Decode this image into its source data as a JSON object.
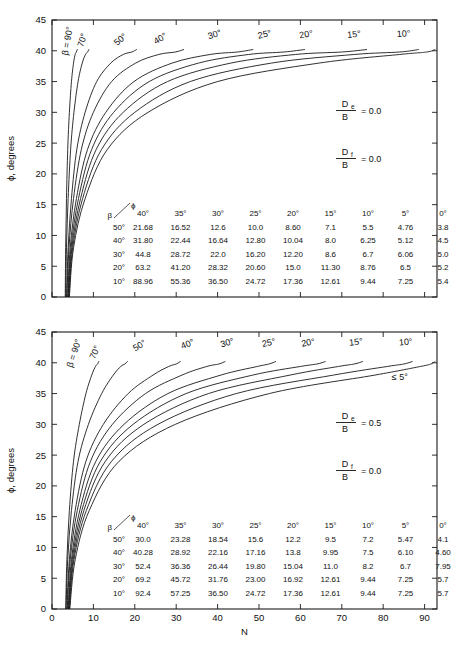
{
  "figure": {
    "axis": {
      "ylabel": "ϕ, degrees",
      "xlabel": "N",
      "yticks": [
        0,
        5,
        10,
        15,
        20,
        25,
        30,
        35,
        40,
        45
      ],
      "xticks": [
        0,
        10,
        20,
        30,
        40,
        50,
        60,
        70,
        80,
        90
      ],
      "xlim": [
        0,
        93
      ],
      "ylim": [
        0,
        45
      ],
      "xtick_labels_visible_top": false,
      "xtick_labels_visible_bottom": true,
      "grid": false
    },
    "line_color": "#1a1a1a"
  },
  "chart_data": [
    {
      "type": "line",
      "panel": "top",
      "title": "",
      "xlabel": "",
      "ylabel": "ϕ, degrees",
      "xlim": [
        0,
        93
      ],
      "ylim": [
        0,
        45
      ],
      "grid": false,
      "legend_position": "inline-curve-labels",
      "annotations": [
        {
          "numerator": "D",
          "subscript": "e",
          "denominator": "B",
          "equals": "= 0.0"
        },
        {
          "numerator": "D",
          "subscript": "f",
          "denominator": "B",
          "equals": "= 0.0"
        }
      ],
      "curve_labels": [
        {
          "text": "β = 90°",
          "x": 4.4,
          "y": 41.5,
          "rotate": -80
        },
        {
          "text": "70°",
          "x": 8.0,
          "y": 41.6,
          "rotate": -72
        },
        {
          "text": "50°",
          "x": 17.0,
          "y": 41.5,
          "rotate": -42
        },
        {
          "text": "40°",
          "x": 26.5,
          "y": 41.6,
          "rotate": -32
        },
        {
          "text": "30°",
          "x": 39.5,
          "y": 42.2,
          "rotate": -18
        },
        {
          "text": "25°",
          "x": 51.5,
          "y": 42.2,
          "rotate": -12
        },
        {
          "text": "20°",
          "x": 61.5,
          "y": 42.2,
          "rotate": -9
        },
        {
          "text": "15°",
          "x": 73.0,
          "y": 42.2,
          "rotate": -6
        },
        {
          "text": "10°",
          "x": 85.0,
          "y": 42.3,
          "rotate": -4
        }
      ],
      "series": [
        {
          "name": "β = 90°",
          "x": [
            3.2,
            3.3,
            3.5,
            3.8,
            4.2,
            4.7,
            5.2,
            5.6,
            5.9,
            6.1
          ],
          "values": [
            0,
            8,
            16,
            24,
            30,
            35,
            38,
            39.4,
            39.8,
            40.2
          ]
        },
        {
          "name": "70°",
          "x": [
            3.3,
            3.5,
            3.9,
            4.5,
            5.3,
            6.3,
            7.3,
            8.1,
            8.6,
            8.9
          ],
          "values": [
            0,
            8,
            16,
            24,
            30,
            35,
            38,
            39.4,
            39.8,
            40.2
          ]
        },
        {
          "name": "50°",
          "x": [
            3.5,
            3.9,
            4.7,
            6.0,
            8.0,
            10.8,
            14.2,
            17.2,
            19.3,
            20.4
          ],
          "values": [
            0,
            8,
            16,
            24,
            30,
            35,
            38,
            39.4,
            39.8,
            40.2
          ]
        },
        {
          "name": "40°",
          "x": [
            3.6,
            4.1,
            5.2,
            7.1,
            10.0,
            14.4,
            20.2,
            25.8,
            29.8,
            31.8
          ],
          "values": [
            0,
            8,
            16,
            24,
            30,
            35,
            38,
            39.4,
            39.8,
            40.2
          ]
        },
        {
          "name": "30°",
          "x": [
            3.8,
            4.4,
            5.9,
            8.6,
            13.0,
            19.8,
            29.0,
            38.2,
            44.8,
            48.5
          ],
          "values": [
            0,
            8,
            16,
            24,
            30,
            35,
            38,
            39.4,
            39.8,
            40.2
          ]
        },
        {
          "name": "25°",
          "x": [
            3.9,
            4.6,
            6.4,
            9.6,
            14.9,
            23.5,
            35.4,
            47.5,
            56.0,
            61.0
          ],
          "values": [
            0,
            8,
            16,
            24,
            30,
            35,
            38,
            39.4,
            39.8,
            40.2
          ]
        },
        {
          "name": "20°",
          "x": [
            4.0,
            4.8,
            6.9,
            10.7,
            17.2,
            27.9,
            43.2,
            58.8,
            70.0,
            76.0
          ],
          "values": [
            0,
            8,
            16,
            24,
            30,
            35,
            38,
            39.4,
            39.8,
            40.2
          ]
        },
        {
          "name": "15°",
          "x": [
            4.1,
            5.0,
            7.4,
            12.0,
            20.0,
            33.4,
            53.0,
            73.0,
            84.0,
            88.5
          ],
          "values": [
            0,
            8,
            16,
            24,
            30,
            35,
            38,
            39.4,
            39.8,
            40.2
          ]
        },
        {
          "name": "10°",
          "x": [
            4.2,
            5.2,
            8.0,
            13.4,
            23.2,
            40.0,
            64.5,
            84.0,
            90.5,
            92.5
          ],
          "values": [
            0,
            8,
            16,
            24,
            30,
            35,
            38,
            39.4,
            39.8,
            40.2
          ]
        }
      ],
      "table": {
        "corner_row_label": "β",
        "corner_col_label": "ϕ",
        "columns": [
          "40°",
          "35°",
          "30°",
          "25°",
          "20°",
          "15°",
          "10°",
          "5°",
          "0°"
        ],
        "rows": [
          {
            "label": "50°",
            "cells": [
              "21.68",
              "16.52",
              "12.6",
              "10.0",
              "8.60",
              "7.1",
              "5.5",
              "4.76",
              "3.8"
            ]
          },
          {
            "label": "40°",
            "cells": [
              "31.80",
              "22.44",
              "16.64",
              "12.80",
              "10.04",
              "8.0",
              "6.25",
              "5.12",
              "4.5"
            ]
          },
          {
            "label": "30°",
            "cells": [
              "44.8",
              "28.72",
              "22.0",
              "16.20",
              "12.20",
              "8.6",
              "6.7",
              "6.06",
              "5.0"
            ]
          },
          {
            "label": "20°",
            "cells": [
              "63.2",
              "41.20",
              "28.32",
              "20.60",
              "15.0",
              "11.30",
              "8.76",
              "6.5",
              "5.2"
            ]
          },
          {
            "label": "10°",
            "cells": [
              "88.96",
              "55.36",
              "36.50",
              "24.72",
              "17.36",
              "12.61",
              "9.44",
              "7.25",
              "5.4"
            ]
          }
        ]
      }
    },
    {
      "type": "line",
      "panel": "bottom",
      "title": "",
      "xlabel": "N",
      "ylabel": "ϕ, degrees",
      "xlim": [
        0,
        93
      ],
      "ylim": [
        0,
        45
      ],
      "grid": false,
      "legend_position": "inline-curve-labels",
      "annotations": [
        {
          "numerator": "D",
          "subscript": "e",
          "denominator": "B",
          "equals": "= 0.5"
        },
        {
          "numerator": "D",
          "subscript": "f",
          "denominator": "B",
          "equals": "= 0.0"
        }
      ],
      "extra_labels": [
        {
          "text": "≤ 5°",
          "x": 84.0,
          "y": 37.2
        }
      ],
      "curve_labels": [
        {
          "text": "β = 90°",
          "x": 6.0,
          "y": 41.4,
          "rotate": -72
        },
        {
          "text": "70°",
          "x": 11.0,
          "y": 41.5,
          "rotate": -66
        },
        {
          "text": "50°",
          "x": 21.5,
          "y": 42.4,
          "rotate": -32
        },
        {
          "text": "40°",
          "x": 33.0,
          "y": 42.6,
          "rotate": -22
        },
        {
          "text": "30°",
          "x": 42.5,
          "y": 42.8,
          "rotate": -16
        },
        {
          "text": "25°",
          "x": 52.5,
          "y": 42.8,
          "rotate": -12
        },
        {
          "text": "20°",
          "x": 62.0,
          "y": 42.8,
          "rotate": -10
        },
        {
          "text": "15°",
          "x": 73.5,
          "y": 42.9,
          "rotate": -7
        },
        {
          "text": "10°",
          "x": 85.5,
          "y": 42.9,
          "rotate": -5
        }
      ],
      "series": [
        {
          "name": "β = 90°",
          "x": [
            3.3,
            3.6,
            4.2,
            5.2,
            6.6,
            8.2,
            9.6,
            10.5,
            11.0,
            11.3
          ],
          "values": [
            0,
            8,
            16,
            24,
            30,
            35,
            38,
            39.4,
            39.8,
            40.2
          ]
        },
        {
          "name": "70°",
          "x": [
            3.4,
            3.8,
            4.7,
            6.3,
            8.8,
            12.0,
            14.8,
            16.6,
            17.6,
            18.2
          ],
          "values": [
            0,
            8,
            16,
            24,
            30,
            35,
            38,
            39.4,
            39.8,
            40.2
          ]
        },
        {
          "name": "50°",
          "x": [
            3.6,
            4.2,
            5.6,
            8.2,
            12.4,
            18.4,
            24.4,
            28.2,
            30.0,
            31.0
          ],
          "values": [
            0,
            8,
            16,
            24,
            30,
            35,
            38,
            39.4,
            39.8,
            40.2
          ]
        },
        {
          "name": "40°",
          "x": [
            3.7,
            4.4,
            6.1,
            9.3,
            14.6,
            22.6,
            31.4,
            37.4,
            40.3,
            41.8
          ],
          "values": [
            0,
            8,
            16,
            24,
            30,
            35,
            38,
            39.4,
            39.8,
            40.2
          ]
        },
        {
          "name": "30°",
          "x": [
            3.9,
            4.7,
            6.7,
            10.6,
            17.4,
            28.0,
            40.8,
            49.6,
            52.4,
            54.0
          ],
          "values": [
            0,
            8,
            16,
            24,
            30,
            35,
            38,
            39.4,
            39.8,
            40.2
          ]
        },
        {
          "name": "25°",
          "x": [
            4.0,
            4.9,
            7.2,
            11.7,
            19.6,
            32.4,
            48.5,
            60.0,
            64.0,
            66.0
          ],
          "values": [
            0,
            8,
            16,
            24,
            30,
            35,
            38,
            39.4,
            39.8,
            40.2
          ]
        },
        {
          "name": "20°",
          "x": [
            4.1,
            5.1,
            7.7,
            12.9,
            22.2,
            37.8,
            57.5,
            69.2,
            73.0,
            75.0
          ],
          "values": [
            0,
            8,
            16,
            24,
            30,
            35,
            38,
            39.4,
            39.8,
            40.2
          ]
        },
        {
          "name": "15°",
          "x": [
            4.2,
            5.3,
            8.3,
            14.4,
            25.6,
            44.5,
            68.0,
            81.0,
            85.0,
            87.0
          ],
          "values": [
            0,
            8,
            16,
            24,
            30,
            35,
            38,
            39.4,
            39.8,
            40.2
          ]
        },
        {
          "name": "10°",
          "x": [
            4.3,
            5.6,
            9.0,
            16.2,
            29.8,
            52.5,
            78.0,
            89.0,
            91.5,
            92.5
          ],
          "values": [
            0,
            8,
            16,
            24,
            30,
            35,
            38,
            39.4,
            39.8,
            40.2
          ]
        }
      ],
      "table": {
        "corner_row_label": "β",
        "corner_col_label": "ϕ",
        "columns": [
          "40°",
          "35°",
          "30°",
          "25°",
          "20°",
          "15°",
          "10°",
          "5°",
          "0°"
        ],
        "rows": [
          {
            "label": "50°",
            "cells": [
              "30.0",
              "23.28",
              "18.54",
              "15.6",
              "12.2",
              "9.5",
              "7.2",
              "5.47",
              "4.1"
            ]
          },
          {
            "label": "40°",
            "cells": [
              "40.28",
              "28.92",
              "22.16",
              "17.16",
              "13.8",
              "9.95",
              "7.5",
              "6.10",
              "4.60"
            ]
          },
          {
            "label": "30°",
            "cells": [
              "52.4",
              "36.36",
              "26.44",
              "19.80",
              "15.04",
              "11.0",
              "8.2",
              "6.7",
              "7.95"
            ]
          },
          {
            "label": "20°",
            "cells": [
              "69.2",
              "45.72",
              "31.76",
              "23.00",
              "16.92",
              "12.61",
              "9.44",
              "7.25",
              "5.7"
            ]
          },
          {
            "label": "10°",
            "cells": [
              "92.4",
              "57.25",
              "36.50",
              "24.72",
              "17.36",
              "12.61",
              "9.44",
              "7.25",
              "5.7"
            ]
          }
        ]
      }
    }
  ]
}
